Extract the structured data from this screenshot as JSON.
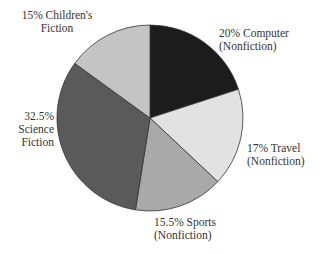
{
  "chart_data": {
    "type": "pie",
    "title": "",
    "start_angle": "12 o'clock",
    "direction": "clockwise",
    "slices": [
      {
        "label": "Computer (Nonfiction)",
        "value": 20,
        "color": "#1c1c1c"
      },
      {
        "label": "Travel (Nonfiction)",
        "value": 17,
        "color": "#e2e2e2"
      },
      {
        "label": "Sports (Nonfiction)",
        "value": 15.5,
        "color": "#a9a9a9"
      },
      {
        "label": "Science Fiction",
        "value": 32.5,
        "color": "#5a5a5a"
      },
      {
        "label": "Children's Fiction",
        "value": 15,
        "color": "#c4c4c4"
      }
    ]
  },
  "labels": {
    "computer": [
      "20% Computer",
      "(Nonfiction)"
    ],
    "travel": [
      "17% Travel",
      "(Nonfiction)"
    ],
    "sports": [
      "15.5% Sports",
      "(Nonfiction)"
    ],
    "science": [
      "32.5%",
      "Science",
      "Fiction"
    ],
    "children": [
      "15% Children's",
      "Fiction"
    ]
  }
}
